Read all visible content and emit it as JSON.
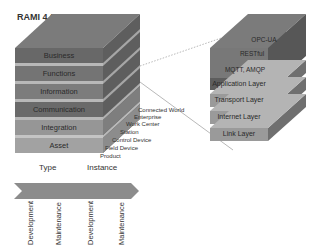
{
  "title": "RAMI 4.0",
  "rami": {
    "layers": [
      "Business",
      "Functions",
      "Information",
      "Communication",
      "Integration",
      "Asset"
    ],
    "hierarchy_levels": [
      "Connected World",
      "Enterprise",
      "Work Center",
      "Station",
      "Control Device",
      "Field Device",
      "Product"
    ],
    "life_cycle": {
      "type_label": "Type",
      "instance_label": "Instance",
      "stages": [
        "Development",
        "Maintenance",
        "Development",
        "Maintenance"
      ]
    }
  },
  "protocol_stack": {
    "top_protocols": [
      "OPC-UA",
      "RESTful",
      "MQTT, AMQP"
    ],
    "layers": [
      "Application Layer",
      "Transport Layer",
      "Internet Layer",
      "Link Layer"
    ]
  },
  "colors": {
    "dark_layer": "#6e6e6e",
    "mid_layer": "#8a8a8a",
    "light_layer": "#a8a8a8",
    "top_face": "#7a7a7a",
    "side_face": "#5a5a5a",
    "arrow": "#8c8c8c"
  }
}
